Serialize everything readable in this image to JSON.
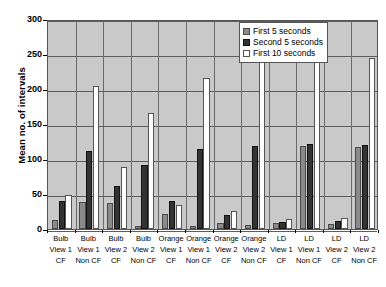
{
  "chart_data": {
    "type": "bar",
    "title": "",
    "xlabel": "",
    "ylabel": "Mean no. of intervals",
    "ylim": [
      0,
      300
    ],
    "yticks": [
      0,
      50,
      100,
      150,
      200,
      250,
      300
    ],
    "grid": true,
    "legend_position": "top-right",
    "categories": [
      "Bulb View 1 CF",
      "Bulb View 1 Non CF",
      "Bulb View 2 CF",
      "Bulb View 2 Non CF",
      "Orange View 1 CF",
      "Orange View 1 Non CF",
      "Orange View 2 CF",
      "Orange View 2 Non CF",
      "LD View 1 CF",
      "LD View 1 Non CF",
      "LD View 2 CF",
      "LD View 2 Non CF"
    ],
    "category_lines": [
      [
        "Bulb",
        "View 1",
        "CF"
      ],
      [
        "Bulb",
        "View 1",
        "Non CF"
      ],
      [
        "Bulb",
        "View 2",
        "CF"
      ],
      [
        "Bulb",
        "View 2",
        "Non CF"
      ],
      [
        "Orange",
        "View 1",
        "CF"
      ],
      [
        "Orange",
        "View 1",
        "Non CF"
      ],
      [
        "Orange",
        "View 2",
        "CF"
      ],
      [
        "Orange",
        "View 2",
        "Non CF"
      ],
      [
        "LD",
        "View 1",
        "CF"
      ],
      [
        "LD",
        "View 1",
        "Non CF"
      ],
      [
        "LD",
        "View 2",
        "CF"
      ],
      [
        "LD",
        "View 2",
        "Non CF"
      ]
    ],
    "series": [
      {
        "name": "First 5 seconds",
        "color": "#8a8a8a",
        "values": [
          13,
          38,
          37,
          4,
          22,
          5,
          8,
          6,
          8,
          118,
          7,
          117
        ]
      },
      {
        "name": "Second 5 seconds",
        "color": "#333333",
        "values": [
          40,
          112,
          62,
          92,
          40,
          115,
          20,
          118,
          10,
          122,
          11,
          120
        ]
      },
      {
        "name": "First 10 seconds",
        "color": "#ffffff",
        "values": [
          48,
          205,
          88,
          166,
          34,
          216,
          26,
          238,
          14,
          245,
          16,
          244
        ]
      }
    ]
  },
  "legend": {
    "items": [
      {
        "label": "First 5 seconds",
        "swatch": "s0"
      },
      {
        "label": "Second 5 seconds",
        "swatch": "s1"
      },
      {
        "label": "First 10 seconds",
        "swatch": "s2"
      }
    ]
  },
  "axis": {
    "y_title": "Mean no. of intervals",
    "y_tick_labels": [
      "300",
      "250",
      "200",
      "150",
      "100",
      "50",
      "0"
    ]
  },
  "colors": {
    "plot_background": "#c9c9c9",
    "page_background": "#ffffff",
    "gridline": "#5d5d5d",
    "axis": "#000000",
    "series_first5": "#8a8a8a",
    "series_second5": "#333333",
    "series_first10": "#ffffff"
  }
}
